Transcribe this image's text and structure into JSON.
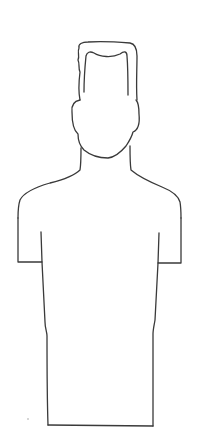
{
  "image": {
    "subject": "line-drawing-human-silhouette",
    "background": "#ffffff",
    "stroke": "#3a3a3a",
    "parts": [
      "hair",
      "head",
      "ears",
      "neck",
      "shoulders",
      "sleeves",
      "torso"
    ]
  }
}
